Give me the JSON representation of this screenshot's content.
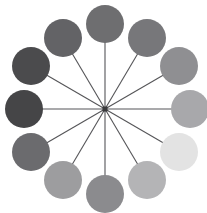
{
  "figure": {
    "canvas": {
      "width": 207,
      "height": 213,
      "background_color": "#ffffff"
    },
    "hub": {
      "label": "center-hub",
      "cx": 105,
      "cy": 109,
      "size": 5,
      "color": "#3a3a3c"
    },
    "spokes": {
      "color": "#555558",
      "width": 1.1,
      "count": 12
    },
    "ring": {
      "radius": 85,
      "node_radius": 19,
      "node_count": 12
    },
    "nodes": [
      {
        "name": "node-12-oclock",
        "index": 0,
        "angle_deg": 270,
        "cx": 105,
        "cy": 24,
        "r": 19,
        "color": "#6e6e70"
      },
      {
        "name": "node-1-oclock",
        "index": 1,
        "angle_deg": 300,
        "cx": 147,
        "cy": 38,
        "r": 19,
        "color": "#77777a"
      },
      {
        "name": "node-2-oclock",
        "index": 2,
        "angle_deg": 330,
        "cx": 179,
        "cy": 66,
        "r": 19,
        "color": "#8f8f92"
      },
      {
        "name": "node-3-oclock",
        "index": 3,
        "angle_deg": 0,
        "cx": 190,
        "cy": 109,
        "r": 19,
        "color": "#a8a8ab"
      },
      {
        "name": "node-4-oclock",
        "index": 4,
        "angle_deg": 30,
        "cx": 179,
        "cy": 152,
        "r": 19,
        "color": "#e3e3e3"
      },
      {
        "name": "node-5-oclock",
        "index": 5,
        "angle_deg": 60,
        "cx": 147,
        "cy": 180,
        "r": 19,
        "color": "#b4b4b6"
      },
      {
        "name": "node-6-oclock",
        "index": 6,
        "angle_deg": 90,
        "cx": 105,
        "cy": 194,
        "r": 19,
        "color": "#8b8b8e"
      },
      {
        "name": "node-7-oclock",
        "index": 7,
        "angle_deg": 120,
        "cx": 63,
        "cy": 180,
        "r": 19,
        "color": "#9d9d9f"
      },
      {
        "name": "node-8-oclock",
        "index": 8,
        "angle_deg": 150,
        "cx": 31,
        "cy": 152,
        "r": 19,
        "color": "#6b6b6e"
      },
      {
        "name": "node-9-oclock",
        "index": 9,
        "angle_deg": 180,
        "cx": 24,
        "cy": 109,
        "r": 19,
        "color": "#454547"
      },
      {
        "name": "node-10-oclock",
        "index": 10,
        "angle_deg": 210,
        "cx": 31,
        "cy": 66,
        "r": 19,
        "color": "#4b4b4d"
      },
      {
        "name": "node-11-oclock",
        "index": 11,
        "angle_deg": 240,
        "cx": 63,
        "cy": 38,
        "r": 19,
        "color": "#636366"
      }
    ]
  },
  "chart_data": {
    "type": "scatter",
    "subtitle": "",
    "xlabel": "",
    "ylabel": "",
    "grid": false,
    "legend": "none",
    "xlim": [
      0,
      207
    ],
    "ylim": [
      0,
      213
    ],
    "categories": [
      "12 o'clock",
      "1 o'clock",
      "2 o'clock",
      "3 o'clock",
      "4 o'clock",
      "5 o'clock",
      "6 o'clock",
      "7 o'clock",
      "8 o'clock",
      "9 o'clock",
      "10 o'clock",
      "11 o'clock"
    ],
    "angles_deg": [
      270,
      300,
      330,
      0,
      30,
      60,
      90,
      120,
      150,
      180,
      210,
      240
    ],
    "values": [
      0.43,
      0.47,
      0.56,
      0.66,
      0.89,
      0.71,
      0.55,
      0.62,
      0.42,
      0.27,
      0.29,
      0.39
    ],
    "series": [
      {
        "name": "Node lightness (0 = black, 1 = white)",
        "values": [
          0.43,
          0.47,
          0.56,
          0.66,
          0.89,
          0.71,
          0.55,
          0.62,
          0.42,
          0.27,
          0.29,
          0.39
        ]
      }
    ],
    "colors": [
      "#6e6e70",
      "#77777a",
      "#8f8f92",
      "#a8a8ab",
      "#e3e3e3",
      "#b4b4b6",
      "#8b8b8e",
      "#9d9d9f",
      "#6b6b6e",
      "#454547",
      "#4b4b4d",
      "#636366"
    ],
    "annotations": [
      "Twelve equal-radius disks evenly spaced every 30 degrees on a ring of radius 85 px",
      "All disks joined to a single dark square hub at the center by thin straight spokes",
      "Fill values form a grayscale ramp: darkest on the left (9 o'clock), lightest at lower right (4 o'clock)"
    ]
  }
}
